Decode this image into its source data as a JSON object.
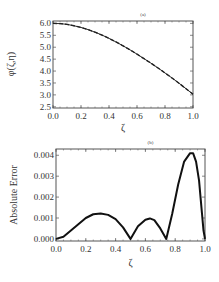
{
  "chart_data": [
    {
      "type": "line",
      "title": "(a)",
      "xlabel": "ζ",
      "ylabel": "φ(ζ,η)",
      "xlim": [
        0.0,
        1.0
      ],
      "ylim": [
        2.45,
        6.1
      ],
      "xticks": [
        "0.0",
        "0.2",
        "0.4",
        "0.6",
        "0.8",
        "1.0"
      ],
      "yticks": [
        "2.5",
        "3.0",
        "3.5",
        "4.0",
        "4.5",
        "5.0",
        "5.5",
        "6.0"
      ],
      "grid": false,
      "series": [
        {
          "name": "exact",
          "style": "solid",
          "x": [
            0.0,
            0.05,
            0.1,
            0.15,
            0.2,
            0.25,
            0.3,
            0.35,
            0.4,
            0.45,
            0.5,
            0.55,
            0.6,
            0.65,
            0.7,
            0.75,
            0.8,
            0.85,
            0.9,
            0.95,
            1.0
          ],
          "y": [
            6.0,
            5.99,
            5.96,
            5.9,
            5.83,
            5.74,
            5.63,
            5.51,
            5.37,
            5.22,
            5.06,
            4.89,
            4.71,
            4.52,
            4.33,
            4.13,
            3.92,
            3.71,
            3.49,
            3.26,
            3.03
          ]
        },
        {
          "name": "approximate",
          "style": "dashed",
          "x": [
            0.0,
            0.05,
            0.1,
            0.15,
            0.2,
            0.25,
            0.3,
            0.35,
            0.4,
            0.45,
            0.5,
            0.55,
            0.6,
            0.65,
            0.7,
            0.75,
            0.8,
            0.85,
            0.9,
            0.95,
            1.0
          ],
          "y": [
            6.0,
            5.99,
            5.96,
            5.9,
            5.83,
            5.74,
            5.63,
            5.51,
            5.37,
            5.22,
            5.06,
            4.89,
            4.71,
            4.52,
            4.33,
            4.13,
            3.92,
            3.71,
            3.49,
            3.26,
            3.03
          ]
        }
      ]
    },
    {
      "type": "line",
      "title": "(b)",
      "xlabel": "ζ",
      "ylabel": "Absolute Error",
      "xlim": [
        0.0,
        1.0
      ],
      "ylim": [
        -0.0001,
        0.0043
      ],
      "xticks": [
        "0.0",
        "0.2",
        "0.4",
        "0.6",
        "0.8",
        "1.0"
      ],
      "yticks": [
        "0.000",
        "0.001",
        "0.002",
        "0.003",
        "0.004"
      ],
      "grid": false,
      "series": [
        {
          "name": "absolute-error",
          "style": "solid",
          "x": [
            0.0,
            0.05,
            0.1,
            0.15,
            0.2,
            0.25,
            0.3,
            0.35,
            0.4,
            0.45,
            0.5,
            0.55,
            0.6,
            0.63,
            0.66,
            0.7,
            0.74,
            0.78,
            0.82,
            0.86,
            0.9,
            0.92,
            0.94,
            0.96,
            0.98,
            0.99,
            1.0
          ],
          "y": [
            0.0,
            0.0001,
            0.0004,
            0.0007,
            0.001,
            0.00118,
            0.00122,
            0.00115,
            0.00095,
            0.00055,
            0.0,
            0.0006,
            0.00092,
            0.00098,
            0.0009,
            0.0005,
            0.0,
            0.0012,
            0.0026,
            0.0037,
            0.0041,
            0.0041,
            0.0037,
            0.0028,
            0.0012,
            0.0004,
            0.0
          ]
        }
      ]
    }
  ]
}
